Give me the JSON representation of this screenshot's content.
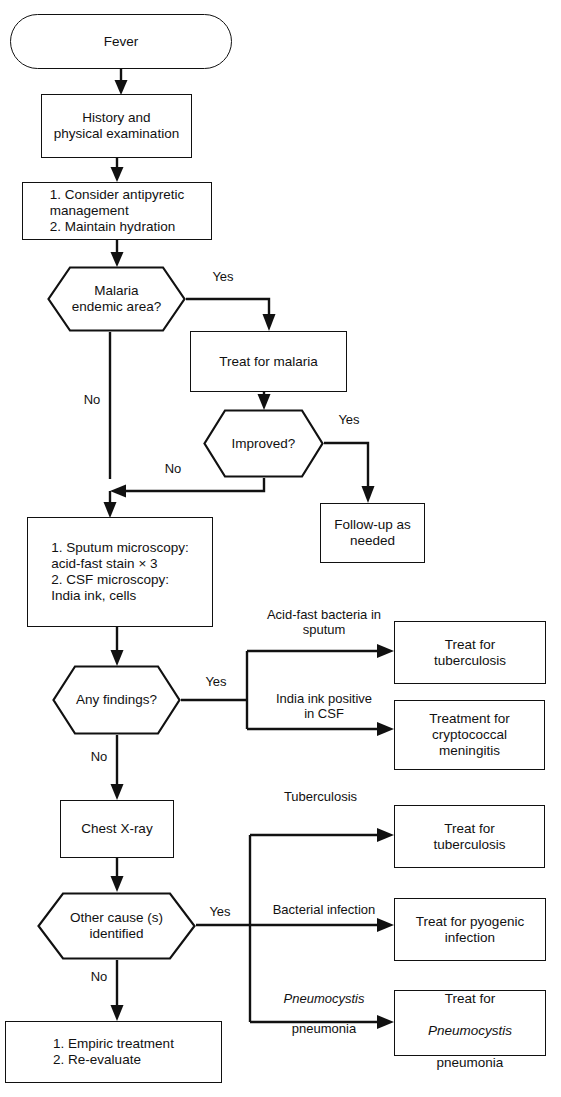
{
  "diagram": {
    "accent_color": "#111111",
    "background": "#ffffff"
  },
  "nodes": {
    "fever": {
      "label": "Fever",
      "shape": "stadium"
    },
    "history": {
      "label": "History and\nphysical examination",
      "shape": "rect"
    },
    "antipyretic": {
      "label": "1. Consider antipyretic\n     management\n2. Maintain hydration",
      "shape": "rect"
    },
    "malaria_q": {
      "label": "Malaria\nendemic area?",
      "shape": "hexagon"
    },
    "treat_malaria": {
      "label": "Treat for malaria",
      "shape": "rect"
    },
    "improved_q": {
      "label": "Improved?",
      "shape": "hexagon"
    },
    "followup": {
      "label": "Follow-up as\nneeded",
      "shape": "rect"
    },
    "microscopy": {
      "label": "1. Sputum microscopy:\n     acid-fast stain × 3\n2. CSF microscopy:\n     India ink, cells",
      "shape": "rect"
    },
    "findings_q": {
      "label": "Any findings?",
      "shape": "hexagon"
    },
    "treat_tb_1": {
      "label": "Treat for\ntuberculosis",
      "shape": "rect"
    },
    "treat_crypto": {
      "label": "Treatment for\ncryptococcal\nmeningitis",
      "shape": "rect"
    },
    "chest_xray": {
      "label": "Chest X-ray",
      "shape": "rect"
    },
    "other_cause_q": {
      "label": "Other cause (s)\nidentified",
      "shape": "hexagon"
    },
    "treat_tb_2": {
      "label": "Treat for\ntuberculosis",
      "shape": "rect"
    },
    "treat_pyogenic": {
      "label": "Treat for pyogenic\ninfection",
      "shape": "rect"
    },
    "treat_pcp_pre": {
      "label": "Treat for"
    },
    "treat_pcp_it": {
      "label": "Pneumocystis"
    },
    "treat_pcp_post": {
      "label": "pneumonia"
    },
    "empiric": {
      "label": "1. Empiric treatment\n2. Re-evaluate",
      "shape": "rect"
    }
  },
  "edge_labels": {
    "malaria_yes": "Yes",
    "malaria_no": "No",
    "improved_yes": "Yes",
    "improved_no": "No",
    "findings_yes": "Yes",
    "findings_no": "No",
    "acid_fast": "Acid-fast bacteria in\nsputum",
    "india_ink": "India ink positive\nin CSF",
    "tuberculosis": "Tuberculosis",
    "other_yes": "Yes",
    "other_no": "No",
    "bacterial": "Bacterial infection",
    "pcp_it": "Pneumocystis",
    "pcp_post": "pneumonia"
  }
}
